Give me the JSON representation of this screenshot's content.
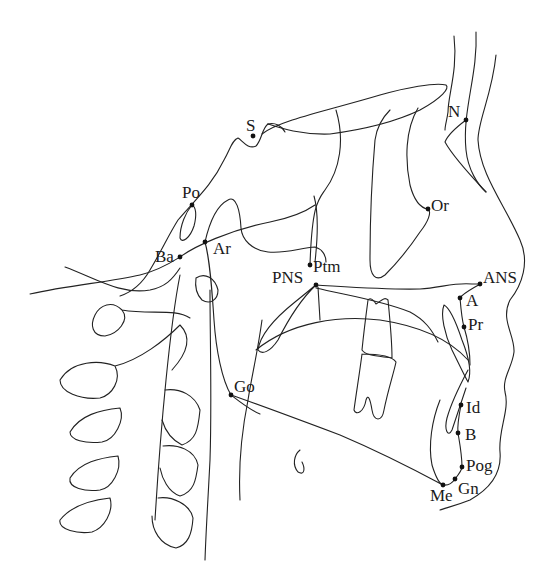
{
  "diagram": {
    "type": "lateral cephalometric tracing",
    "colors": {
      "line": "#222222",
      "label": "#1a1a1a",
      "background": "#ffffff"
    },
    "landmarks": [
      {
        "id": "S",
        "label": "S",
        "x": 253,
        "y": 136,
        "lx": 246,
        "ly": 131,
        "anchor": "start"
      },
      {
        "id": "N",
        "label": "N",
        "x": 466,
        "y": 120,
        "lx": 448,
        "ly": 117,
        "anchor": "start"
      },
      {
        "id": "Or",
        "label": "Or",
        "x": 428,
        "y": 209,
        "lx": 431,
        "ly": 211,
        "anchor": "start"
      },
      {
        "id": "Po",
        "label": "Po",
        "x": 192,
        "y": 205,
        "lx": 182,
        "ly": 198,
        "anchor": "start"
      },
      {
        "id": "Ba",
        "label": "Ba",
        "x": 180,
        "y": 257,
        "lx": 155,
        "ly": 262,
        "anchor": "start"
      },
      {
        "id": "Ar",
        "label": "Ar",
        "x": 205,
        "y": 242,
        "lx": 213,
        "ly": 254,
        "anchor": "start"
      },
      {
        "id": "Ptm",
        "label": "Ptm",
        "x": 310,
        "y": 265,
        "lx": 313,
        "ly": 272,
        "anchor": "start"
      },
      {
        "id": "PNS",
        "label": "PNS",
        "x": 316,
        "y": 285,
        "lx": 272,
        "ly": 283,
        "anchor": "start"
      },
      {
        "id": "ANS",
        "label": "ANS",
        "x": 480,
        "y": 284,
        "lx": 483,
        "ly": 283,
        "anchor": "start"
      },
      {
        "id": "A",
        "label": "A",
        "x": 460,
        "y": 298,
        "lx": 466,
        "ly": 306,
        "anchor": "start"
      },
      {
        "id": "Pr",
        "label": "Pr",
        "x": 464,
        "y": 327,
        "lx": 468,
        "ly": 330,
        "anchor": "start"
      },
      {
        "id": "Id",
        "label": "Id",
        "x": 461,
        "y": 405,
        "lx": 466,
        "ly": 413,
        "anchor": "start"
      },
      {
        "id": "B",
        "label": "B",
        "x": 458,
        "y": 433,
        "lx": 465,
        "ly": 440,
        "anchor": "start"
      },
      {
        "id": "Pog",
        "label": "Pog",
        "x": 462,
        "y": 467,
        "lx": 466,
        "ly": 471,
        "anchor": "start"
      },
      {
        "id": "Gn",
        "label": "Gn",
        "x": 455,
        "y": 479,
        "lx": 458,
        "ly": 494,
        "anchor": "start"
      },
      {
        "id": "Me",
        "label": "Me",
        "x": 443,
        "y": 485,
        "lx": 430,
        "ly": 501,
        "anchor": "start"
      },
      {
        "id": "Go",
        "label": "Go",
        "x": 231,
        "y": 395,
        "lx": 234,
        "ly": 392,
        "anchor": "start"
      }
    ]
  }
}
